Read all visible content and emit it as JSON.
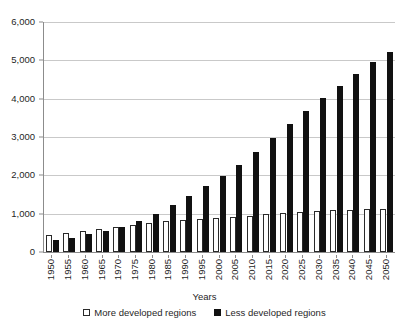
{
  "chart_data": {
    "type": "bar",
    "title": "",
    "subtitle": "",
    "xlabel": "Years",
    "ylabel": "",
    "ylim": [
      0,
      6000
    ],
    "yticks": [
      0,
      1000,
      2000,
      3000,
      4000,
      5000,
      6000
    ],
    "ytick_labels": [
      "0",
      "1,000",
      "2,000",
      "3,000",
      "4,000",
      "5,000",
      "6,000"
    ],
    "grid": true,
    "legend_position": "bottom",
    "categories": [
      "1950",
      "1955",
      "1960",
      "1965",
      "1970",
      "1975",
      "1980",
      "1985",
      "1990",
      "1995",
      "2000",
      "2005",
      "2010",
      "2015",
      "2020",
      "2025",
      "2030",
      "2035",
      "2040",
      "2045",
      "2050"
    ],
    "series": [
      {
        "name": "More developed regions",
        "color": "#ffffff",
        "edge_color": "#2a2a2a",
        "values": [
          455,
          500,
          545,
          605,
          665,
          715,
          755,
          805,
          835,
          865,
          890,
          920,
          950,
          995,
          1025,
          1050,
          1070,
          1090,
          1100,
          1115,
          1130
        ]
      },
      {
        "name": "Less developed regions",
        "color": "#111111",
        "edge_color": "#111111",
        "values": [
          320,
          370,
          460,
          545,
          665,
          820,
          990,
          1220,
          1470,
          1720,
          1980,
          2280,
          2610,
          2980,
          3330,
          3680,
          4020,
          4320,
          4650,
          4950,
          5230
        ]
      }
    ]
  },
  "legend": {
    "items": [
      {
        "label": "More developed regions",
        "swatch": "open-square"
      },
      {
        "label": "Less developed regions",
        "swatch": "filled-square"
      }
    ]
  },
  "axes": {
    "x_title": "Years"
  },
  "colors": {
    "background": "#ffffff",
    "gridline": "#c9c9c9",
    "axis": "#8c8c8c",
    "text": "#1f1f1f",
    "series_more": "#ffffff",
    "series_less": "#111111"
  }
}
